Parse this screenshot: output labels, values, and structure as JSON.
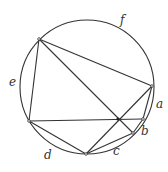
{
  "diagram": {
    "type": "inscribed-polygon-in-circle",
    "stroke_color": "#333333",
    "background": "#ffffff",
    "circle": {
      "cx": 87,
      "cy": 87,
      "r": 67
    },
    "points": {
      "P1": [
        39,
        39
      ],
      "P2": [
        152,
        86
      ],
      "P3": [
        143,
        119
      ],
      "P4": [
        133,
        133
      ],
      "P5": [
        86,
        154
      ],
      "P6": [
        29,
        121
      ],
      "X": [
        118,
        119
      ]
    },
    "arc_labels": [
      {
        "text": "a",
        "x": 156,
        "y": 98
      },
      {
        "text": "b",
        "x": 141,
        "y": 125
      },
      {
        "text": "c",
        "x": 113,
        "y": 145
      },
      {
        "text": "d",
        "x": 44,
        "y": 149
      },
      {
        "text": "e",
        "x": 9,
        "y": 76
      },
      {
        "text": "f",
        "x": 120,
        "y": 14
      }
    ]
  }
}
